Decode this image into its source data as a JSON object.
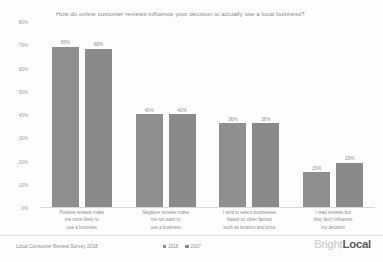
{
  "chart_data": {
    "type": "bar",
    "title": "How do online customer reviews influence your decision to actually use a local business?",
    "xlabel": "",
    "ylabel": "",
    "ylim": [
      0,
      80
    ],
    "ytick_labels": [
      "80%",
      "70%",
      "60%",
      "50%",
      "40%",
      "30%",
      "20%",
      "10%",
      "0%"
    ],
    "ytick_values": [
      80,
      70,
      60,
      50,
      40,
      30,
      20,
      10,
      0
    ],
    "grid": false,
    "legend_position": "bottom-center",
    "categories": [
      "Positive reviews make me more likely to use a business",
      "Negative reviews make me not want to use a business",
      "I tend to select businesses based on other factors such as location and price",
      "I read reviews but they don't influence my decision"
    ],
    "category_lines": [
      [
        "Positive reviews make",
        "me more likely to",
        "use a business"
      ],
      [
        "Negative reviews make",
        "me not want to",
        "use a business"
      ],
      [
        "I tend to select businesses",
        "based on other factors",
        "such as location and price"
      ],
      [
        "I read reviews but",
        "they don't influence",
        "my decision"
      ]
    ],
    "series": [
      {
        "name": "2018",
        "color": "#8f8f8f",
        "values": [
          69,
          40,
          36,
          15
        ],
        "labels": [
          "69%",
          "40%",
          "36%",
          "15%"
        ]
      },
      {
        "name": "2017",
        "color": "#8a8a8a",
        "values": [
          68,
          40,
          36,
          19
        ],
        "labels": [
          "68%",
          "40%",
          "36%",
          "19%"
        ]
      }
    ]
  },
  "footer": {
    "source": "Local Consumer Review Survey 2018",
    "brand_prefix": "Bright",
    "brand_suffix": "Local"
  }
}
